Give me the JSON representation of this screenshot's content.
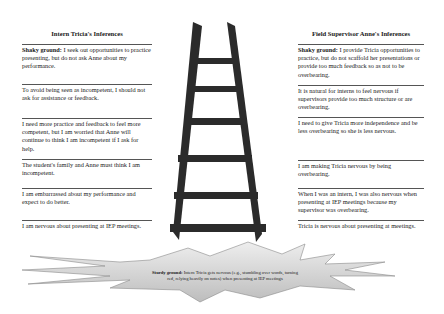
{
  "left_column": {
    "title": "Intern Tricia's Inferences",
    "items": [
      {
        "label": "Shaky ground:",
        "text": " I seek out opportunities to practice presenting, but do not ask Anne about my performance."
      },
      {
        "label": "",
        "text": "To avoid being seen as incompetent, I should not ask for assistance or feedback."
      },
      {
        "label": "",
        "text": "I need more practice and feedback to feel more competent, but I am worried that Anne will continue to think I am incompetent if I ask for help."
      },
      {
        "label": "",
        "text": "The student's family and Anne must think I am incompetent."
      },
      {
        "label": "",
        "text": "I am embarrassed about my performance and expect to do better."
      },
      {
        "label": "",
        "text": "I am nervous about presenting at IEP meetings."
      }
    ]
  },
  "right_column": {
    "title": "Field Supervisor Anne's Inferences",
    "items": [
      {
        "label": "Shaky ground:",
        "text": " I provide Tricia opportunities to practice, but do not scaffold her presentations or provide too much feedback so as not to be overbearing."
      },
      {
        "label": "",
        "text": "It is natural for interns to feel nervous if supervisors provide too much structure or are overbearing."
      },
      {
        "label": "",
        "text": "I need to give Tricia more independence and be less overbearing so she is less nervous."
      },
      {
        "label": "",
        "text": "I am making Tricia nervous by being overbearing."
      },
      {
        "label": "",
        "text": "When I was an intern, I was also nervous when presenting at IEP meetings because my supervisor was overbearing."
      },
      {
        "label": "",
        "text": "Tricia is nervous about presenting at meetings."
      }
    ]
  },
  "ladder": {
    "icon": "ladder-icon",
    "rungs": 6,
    "color": "#2b2b2b"
  },
  "sturdy_ground": {
    "label": "Sturdy ground:",
    "text": " Intern Tricia gets nervous (e.g., stumbling over words, turning red, relying heavily on notes) when presenting at IEP meetings",
    "fill": "#d9d9d9"
  }
}
